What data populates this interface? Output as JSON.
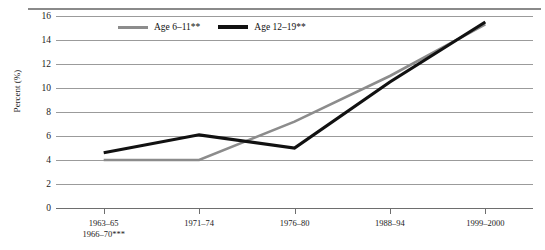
{
  "chart_data": {
    "type": "line",
    "title": "",
    "xlabel": "",
    "ylabel": "Percent (%)",
    "ylim": [
      0,
      16
    ],
    "yticks": [
      0,
      2,
      4,
      6,
      8,
      10,
      12,
      14,
      16
    ],
    "grid": true,
    "legend_position": "top-center",
    "categories": [
      "1963–65\n1966–70***",
      "1971–74",
      "1976–80",
      "1988–94",
      "1999–2000"
    ],
    "category_lines": [
      [
        "1963–65",
        "1966–70***"
      ],
      [
        "1971–74"
      ],
      [
        "1976–80"
      ],
      [
        "1988–94"
      ],
      [
        "1999–2000"
      ]
    ],
    "series": [
      {
        "name": "Age 6–11**",
        "color": "#8c8c8c",
        "values": [
          4.0,
          4.0,
          7.2,
          11.0,
          15.3
        ]
      },
      {
        "name": "Age 12–19**",
        "color": "#111111",
        "values": [
          4.6,
          6.1,
          5.0,
          10.5,
          15.5
        ]
      }
    ]
  },
  "axis": {
    "y_label": "Percent (%)",
    "y_tick_labels": [
      "16",
      "14",
      "12",
      "10",
      "8",
      "6",
      "4",
      "2",
      "0"
    ]
  },
  "legend": {
    "items": [
      {
        "label": "Age 6–11**"
      },
      {
        "label": "Age 12–19**"
      }
    ]
  }
}
